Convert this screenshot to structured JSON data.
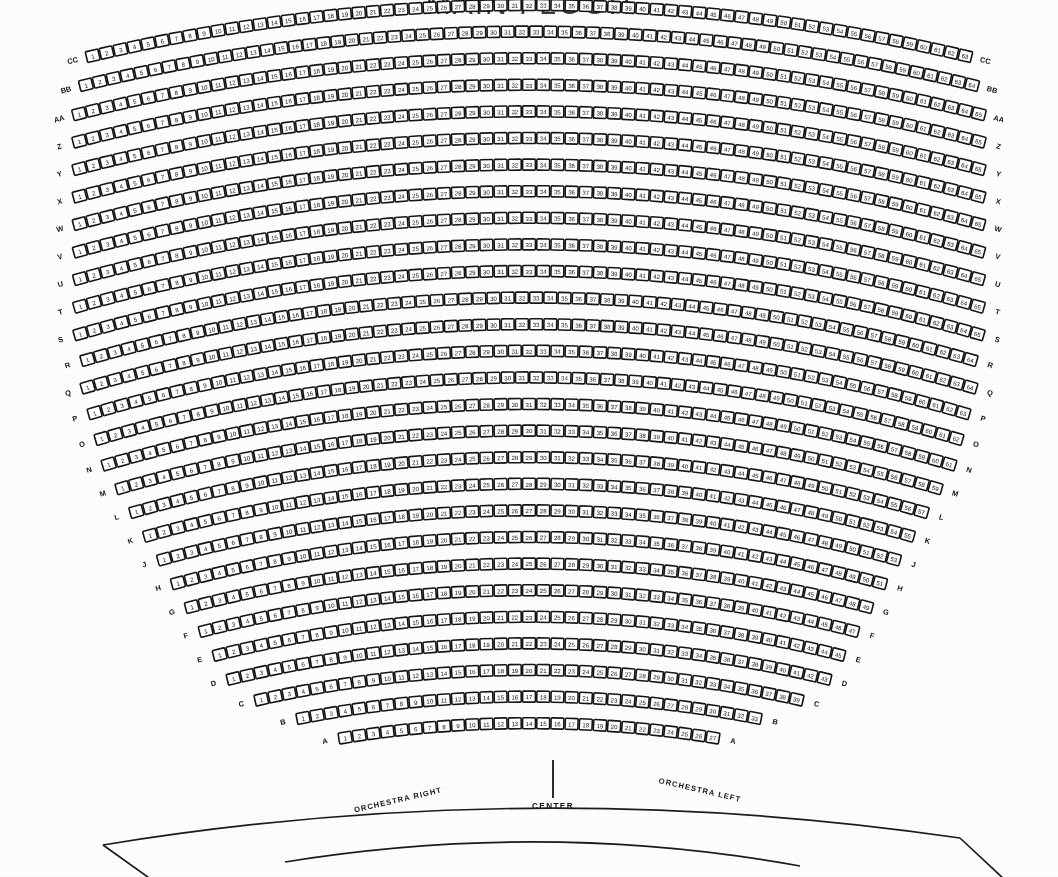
{
  "title": "MAIN FLOOR",
  "venue_section": "Orchestra / Main Floor",
  "labels": {
    "center": "CENTER",
    "orchestra_right": "ORCHESTRA RIGHT",
    "orchestra_left": "ORCHESTRA LEFT"
  },
  "colors": {
    "ink": "#151515",
    "seat_fill": "#ffffff",
    "paper": "#fdfdfc",
    "title": "#3a3a3a"
  },
  "chart_data": {
    "type": "table",
    "title": "MAIN FLOOR",
    "xlabel": "Seat number",
    "ylabel": "Row",
    "legend": [
      "ORCHESTRA RIGHT",
      "CENTER",
      "ORCHESTRA LEFT"
    ],
    "grid": false,
    "row_label_sides": [
      "left",
      "right"
    ],
    "seat_numbering": "sequential left to right starting at 1 in the rear rows",
    "rows": [
      {
        "row": "CC",
        "first_seat": 1,
        "last_seat": 63,
        "seat_count": 63
      },
      {
        "row": "BB",
        "first_seat": 1,
        "last_seat": 64,
        "seat_count": 64
      },
      {
        "row": "AA",
        "first_seat": 1,
        "last_seat": 65,
        "seat_count": 65
      },
      {
        "row": "Z",
        "first_seat": 1,
        "last_seat": 65,
        "seat_count": 65
      },
      {
        "row": "Y",
        "first_seat": 1,
        "last_seat": 65,
        "seat_count": 65
      },
      {
        "row": "X",
        "first_seat": 1,
        "last_seat": 65,
        "seat_count": 65
      },
      {
        "row": "W",
        "first_seat": 1,
        "last_seat": 65,
        "seat_count": 65
      },
      {
        "row": "V",
        "first_seat": 1,
        "last_seat": 65,
        "seat_count": 65
      },
      {
        "row": "U",
        "first_seat": 1,
        "last_seat": 65,
        "seat_count": 65
      },
      {
        "row": "T",
        "first_seat": 1,
        "last_seat": 65,
        "seat_count": 65
      },
      {
        "row": "S",
        "first_seat": 1,
        "last_seat": 65,
        "seat_count": 65
      },
      {
        "row": "R",
        "first_seat": 1,
        "last_seat": 64,
        "seat_count": 64
      },
      {
        "row": "Q",
        "first_seat": 1,
        "last_seat": 64,
        "seat_count": 64
      },
      {
        "row": "P",
        "first_seat": 1,
        "last_seat": 63,
        "seat_count": 63
      },
      {
        "row": "O",
        "first_seat": 1,
        "last_seat": 62,
        "seat_count": 62
      },
      {
        "row": "N",
        "first_seat": 1,
        "last_seat": 61,
        "seat_count": 61
      },
      {
        "row": "M",
        "first_seat": 1,
        "last_seat": 59,
        "seat_count": 59
      },
      {
        "row": "L",
        "first_seat": 1,
        "last_seat": 57,
        "seat_count": 57
      },
      {
        "row": "K",
        "first_seat": 1,
        "last_seat": 55,
        "seat_count": 55
      },
      {
        "row": "J",
        "first_seat": 1,
        "last_seat": 53,
        "seat_count": 53
      },
      {
        "row": "H",
        "first_seat": 1,
        "last_seat": 51,
        "seat_count": 51
      },
      {
        "row": "G",
        "first_seat": 1,
        "last_seat": 49,
        "seat_count": 49
      },
      {
        "row": "F",
        "first_seat": 1,
        "last_seat": 47,
        "seat_count": 47
      },
      {
        "row": "E",
        "first_seat": 1,
        "last_seat": 45,
        "seat_count": 45
      },
      {
        "row": "D",
        "first_seat": 1,
        "last_seat": 43,
        "seat_count": 43
      },
      {
        "row": "C",
        "first_seat": 1,
        "last_seat": 39,
        "seat_count": 39
      },
      {
        "row": "B",
        "first_seat": 1,
        "last_seat": 33,
        "seat_count": 33
      },
      {
        "row": "A",
        "first_seat": 1,
        "last_seat": 27,
        "seat_count": 27
      }
    ],
    "total_rows": 28,
    "total_seats": 1553
  },
  "geometry": {
    "center_x": 529,
    "arc_center_y": 1905,
    "first_row_radius": 1900,
    "row_pitch": 26.6,
    "seat_span_deg": 1.52
  }
}
